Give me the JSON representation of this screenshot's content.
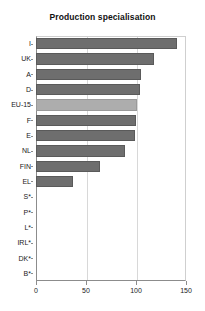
{
  "chart_data": {
    "type": "bar",
    "orientation": "horizontal",
    "title": "Production specialisation",
    "xlabel": "",
    "ylabel": "",
    "xlim": [
      0,
      150
    ],
    "xticks": [
      0,
      50,
      100,
      150
    ],
    "xticklabels": [
      "0",
      "50",
      "100",
      "150"
    ],
    "grid": true,
    "grid_axis": "x",
    "legend": "none",
    "categories": [
      "I",
      "UK",
      "A",
      "D",
      "EU-15",
      "F",
      "E",
      "NL",
      "FIN",
      "EL",
      "S*",
      "P*",
      "L*",
      "IRL*",
      "DK*",
      "B*"
    ],
    "values": [
      141,
      118,
      105,
      104,
      101,
      100,
      99,
      89,
      64,
      37,
      null,
      null,
      null,
      null,
      null,
      null
    ],
    "highlight_category": "EU-15",
    "bar_color": "#6e6e6e",
    "highlight_color": "#adadad",
    "note": "Categories marked with * have no data shown"
  }
}
